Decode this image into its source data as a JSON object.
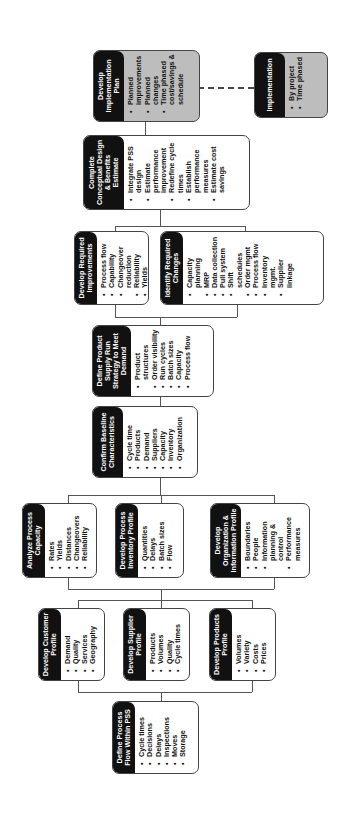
{
  "diagram": {
    "orientation": "rotated-90-ccw",
    "boxes": {
      "implementation_plan": {
        "title": "Develop Implementation Plan",
        "items": [
          "Planned improvements",
          "Planned changes",
          "Time phased cost/savings & schedule"
        ]
      },
      "implementation": {
        "title": "Implementation",
        "items": [
          "By project",
          "Time phased"
        ]
      },
      "conceptual_design": {
        "title": "Complete Conceptual Design & Benefits Estimate",
        "items": [
          "Integrate PSS design",
          "Estimate performance improvement",
          "Redefine cycle times",
          "Establish performance measures",
          "Estimate cost savings"
        ]
      },
      "required_improvements": {
        "title": "Develop Required Improvements",
        "items": [
          "Process flow",
          "Capability",
          "Changeover reduction",
          "Reliability",
          "Yields"
        ]
      },
      "required_changes": {
        "title": "Identify Required Changes",
        "items": [
          "Capacity planning",
          "MRP",
          "Data collection",
          "Pull system",
          "Shift schedules",
          "Order mgmt",
          "Process flow",
          "Inventory mgmt.",
          "Supplier linkage"
        ]
      },
      "supply_run": {
        "title": "Define Product Supply Run Strategy to Meet Demand",
        "items": [
          "Product structures",
          "Order visibility",
          "Run cycles",
          "Batch sizes",
          "Capacity",
          "Process flow"
        ]
      },
      "baseline": {
        "title": "Confirm Baseline Characteristics",
        "items": [
          "Cycle time",
          "Products",
          "Demand",
          "Suppliers",
          "Capacity",
          "Inventory",
          "Organization"
        ]
      },
      "process_capacity": {
        "title": "Analyze Process Capacity",
        "items": [
          "Rates",
          "Yields",
          "Distances",
          "Changeovers",
          "Reliability"
        ]
      },
      "inventory_profile": {
        "title": "Develop Process Inventory Profile",
        "items": [
          "Quantities",
          "Delays",
          "Batch sizes",
          "Flow"
        ]
      },
      "org_info_profile": {
        "title": "Develop Organization & Information Profile",
        "items": [
          "Boundaries",
          "People",
          "Information planning & control",
          "Performance measures"
        ]
      },
      "customer_profile": {
        "title": "Develop Customer Profile",
        "items": [
          "Demand",
          "Quality",
          "Services",
          "Geography"
        ]
      },
      "supplier_profile": {
        "title": "Develop Supplier Profile",
        "items": [
          "Products",
          "Volumes",
          "Quality",
          "Cycle times"
        ]
      },
      "products_profile": {
        "title": "Develop Products Profile",
        "items": [
          "Volumes",
          "Variety",
          "Costs",
          "Prices"
        ]
      },
      "process_flow": {
        "title": "Define Process Flow Within PSS",
        "items": [
          "Cycle times",
          "Decisions",
          "Delays",
          "Inspections",
          "Moves",
          "Storage"
        ]
      }
    },
    "colors": {
      "header": "#111111",
      "shaded_box": "#bdbdbd",
      "line": "#555555"
    }
  }
}
